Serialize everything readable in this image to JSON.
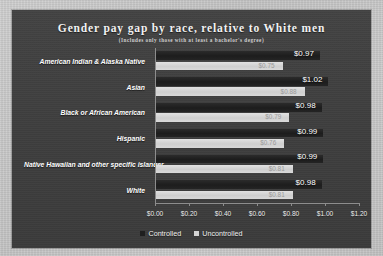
{
  "chart_data": {
    "type": "bar",
    "orientation": "horizontal",
    "title": "Gender pay gap by race, relative to White men",
    "subtitle": "(Includes only those with at least a bachelor's degree)",
    "xlabel": "",
    "ylabel": "",
    "xlim": [
      0,
      1.2
    ],
    "grid": false,
    "legend_position": "bottom-center",
    "categories": [
      "American Indian & Alaska Native",
      "Asian",
      "Black or African American",
      "Hispanic",
      "Native Hawaiian and other specific islander",
      "White"
    ],
    "xtick_labels": [
      "$0.00",
      "$0.20",
      "$0.40",
      "$0.60",
      "$0.80",
      "$1.00",
      "$1.20"
    ],
    "xtick_values": [
      0.0,
      0.2,
      0.4,
      0.6,
      0.8,
      1.0,
      1.2
    ],
    "series": [
      {
        "name": "Controlled",
        "color": "#1f1f1f",
        "values": [
          0.97,
          1.02,
          0.98,
          0.99,
          0.99,
          0.98
        ],
        "labels": [
          "$0.97",
          "$1.02",
          "$0.98",
          "$0.99",
          "$0.99",
          "$0.98"
        ],
        "label_position": "outside"
      },
      {
        "name": "Uncontrolled",
        "color": "#d4d4d4",
        "values": [
          0.75,
          0.88,
          0.79,
          0.76,
          0.81,
          0.81
        ],
        "labels": [
          "$0.75",
          "$0.88",
          "$0.79",
          "$0.76",
          "$0.81",
          "$0.81"
        ],
        "label_position": "inside-end"
      }
    ]
  },
  "legend": {
    "items": [
      {
        "label": "Controlled",
        "color": "#1f1f1f"
      },
      {
        "label": "Uncontrolled",
        "color": "#d4d4d4"
      }
    ]
  },
  "colors": {
    "page_background": "#c9c9c9",
    "panel_background": "#3e3e3e",
    "controlled_bar": "#1f1f1f",
    "uncontrolled_bar": "#d4d4d4",
    "axis": "#8d8d8d",
    "title_text": "#f2f2f2"
  }
}
